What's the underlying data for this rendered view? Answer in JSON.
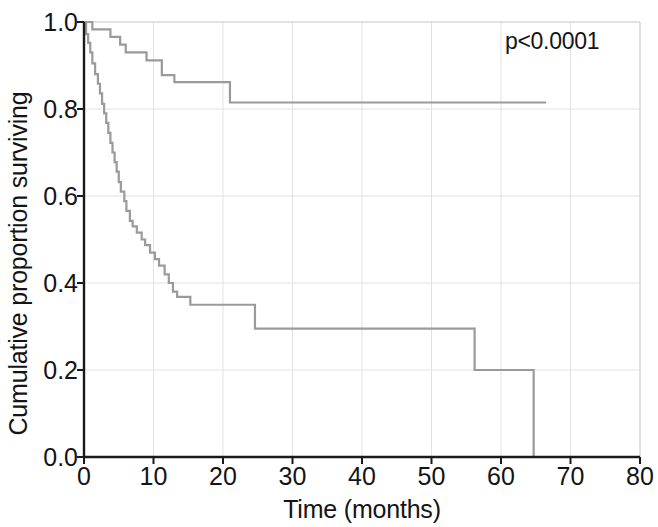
{
  "chart_data": {
    "type": "line",
    "chart_kind": "kaplan-meier-survival-curve",
    "title": "",
    "xlabel": "Time (months)",
    "ylabel": "Cumulative proportion surviving",
    "xlim": [
      0,
      80
    ],
    "ylim": [
      0.0,
      1.0
    ],
    "xticks": [
      0,
      10,
      20,
      30,
      40,
      50,
      60,
      70,
      80
    ],
    "xtick_labels": [
      "0",
      "10",
      "20",
      "30",
      "40",
      "50",
      "60",
      "70",
      "80"
    ],
    "yticks": [
      0.0,
      0.2,
      0.4,
      0.6,
      0.8,
      1.0
    ],
    "ytick_labels": [
      "0.0",
      "0.2",
      "0.4",
      "0.6",
      "0.8",
      "1.0"
    ],
    "grid": true,
    "grid_color": "#e2e2e2",
    "legend": null,
    "legend_position": "none",
    "annotations": [
      {
        "text": "p<0.0001",
        "x": 64,
        "y": 0.96
      }
    ],
    "series": [
      {
        "name": "upper-survival-curve",
        "color": "#9a9a9a",
        "step": "post",
        "points": [
          [
            0.0,
            1.0
          ],
          [
            1.2,
            1.0
          ],
          [
            1.2,
            0.983
          ],
          [
            3.8,
            0.983
          ],
          [
            3.8,
            0.966
          ],
          [
            5.2,
            0.966
          ],
          [
            5.2,
            0.948
          ],
          [
            6.0,
            0.948
          ],
          [
            6.0,
            0.93
          ],
          [
            9.0,
            0.93
          ],
          [
            9.0,
            0.912
          ],
          [
            11.2,
            0.912
          ],
          [
            11.2,
            0.878
          ],
          [
            13.0,
            0.878
          ],
          [
            13.0,
            0.862
          ],
          [
            21.0,
            0.862
          ],
          [
            21.0,
            0.815
          ],
          [
            66.5,
            0.815
          ]
        ]
      },
      {
        "name": "lower-survival-curve",
        "color": "#9a9a9a",
        "step": "post",
        "points": [
          [
            0.0,
            1.0
          ],
          [
            0.3,
            1.0
          ],
          [
            0.3,
            0.972
          ],
          [
            0.6,
            0.972
          ],
          [
            0.6,
            0.952
          ],
          [
            0.9,
            0.952
          ],
          [
            0.9,
            0.93
          ],
          [
            1.2,
            0.93
          ],
          [
            1.2,
            0.905
          ],
          [
            1.6,
            0.905
          ],
          [
            1.6,
            0.88
          ],
          [
            2.0,
            0.88
          ],
          [
            2.0,
            0.858
          ],
          [
            2.3,
            0.858
          ],
          [
            2.3,
            0.836
          ],
          [
            2.6,
            0.836
          ],
          [
            2.6,
            0.812
          ],
          [
            2.9,
            0.812
          ],
          [
            2.9,
            0.79
          ],
          [
            3.2,
            0.79
          ],
          [
            3.2,
            0.768
          ],
          [
            3.5,
            0.768
          ],
          [
            3.5,
            0.745
          ],
          [
            3.8,
            0.745
          ],
          [
            3.8,
            0.722
          ],
          [
            4.1,
            0.722
          ],
          [
            4.1,
            0.7
          ],
          [
            4.4,
            0.7
          ],
          [
            4.4,
            0.678
          ],
          [
            4.7,
            0.678
          ],
          [
            4.7,
            0.656
          ],
          [
            5.0,
            0.656
          ],
          [
            5.0,
            0.632
          ],
          [
            5.3,
            0.632
          ],
          [
            5.3,
            0.61
          ],
          [
            5.8,
            0.61
          ],
          [
            5.8,
            0.588
          ],
          [
            6.1,
            0.588
          ],
          [
            6.1,
            0.566
          ],
          [
            6.6,
            0.566
          ],
          [
            6.6,
            0.543
          ],
          [
            7.0,
            0.543
          ],
          [
            7.0,
            0.53
          ],
          [
            7.6,
            0.53
          ],
          [
            7.6,
            0.516
          ],
          [
            8.3,
            0.516
          ],
          [
            8.3,
            0.5
          ],
          [
            8.8,
            0.5
          ],
          [
            8.8,
            0.487
          ],
          [
            9.5,
            0.487
          ],
          [
            9.5,
            0.47
          ],
          [
            10.2,
            0.47
          ],
          [
            10.2,
            0.455
          ],
          [
            10.8,
            0.455
          ],
          [
            10.8,
            0.44
          ],
          [
            11.6,
            0.44
          ],
          [
            11.6,
            0.42
          ],
          [
            12.2,
            0.42
          ],
          [
            12.2,
            0.4
          ],
          [
            12.8,
            0.4
          ],
          [
            12.8,
            0.38
          ],
          [
            13.4,
            0.38
          ],
          [
            13.4,
            0.368
          ],
          [
            15.3,
            0.368
          ],
          [
            15.3,
            0.35
          ],
          [
            24.6,
            0.35
          ],
          [
            24.6,
            0.295
          ],
          [
            56.2,
            0.295
          ],
          [
            56.2,
            0.2
          ],
          [
            64.7,
            0.2
          ],
          [
            64.7,
            0.0
          ]
        ]
      }
    ]
  },
  "axes": {
    "axis_color": "#1a1a1a",
    "plot_border_color": "#d2d2d2"
  }
}
